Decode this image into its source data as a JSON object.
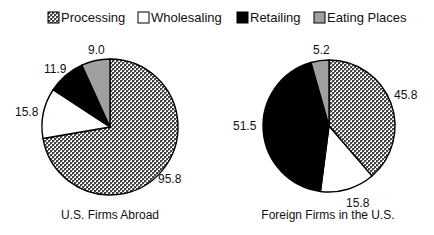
{
  "chart_data": [
    {
      "type": "pie",
      "title": "U.S. Firms Abroad",
      "categories": [
        "Processing",
        "Wholesaling",
        "Retailing",
        "Eating Places"
      ],
      "values": [
        95.8,
        15.8,
        11.9,
        9.0
      ],
      "start": "top, clockwise from Processing"
    },
    {
      "type": "pie",
      "title": "Foreign Firms in the U.S.",
      "categories": [
        "Processing",
        "Wholesaling",
        "Retailing",
        "Eating Places"
      ],
      "values": [
        45.8,
        15.8,
        51.5,
        5.2
      ],
      "start": "top, clockwise from Processing"
    }
  ],
  "legend": {
    "position": "top",
    "items": [
      {
        "label": "Processing",
        "fill": "pattern-checker"
      },
      {
        "label": "Wholesaling",
        "fill": "#ffffff"
      },
      {
        "label": "Retailing",
        "fill": "#000000"
      },
      {
        "label": "Eating Places",
        "fill": "#a0a0a0"
      }
    ]
  },
  "pies": [
    {
      "title": "U.S. Firms Abroad",
      "labels": [
        "95.8",
        "15.8",
        "11.9",
        "9.0"
      ]
    },
    {
      "title": "Foreign Firms in the U.S.",
      "labels": [
        "45.8",
        "15.8",
        "51.5",
        "5.2"
      ]
    }
  ]
}
